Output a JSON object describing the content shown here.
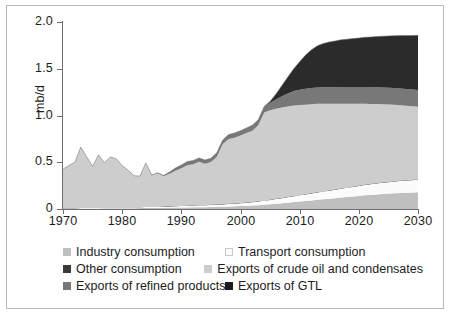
{
  "chart_data": {
    "type": "area",
    "stacked": true,
    "title": "",
    "subtitle": "",
    "xlabel": "",
    "ylabel": "mb/d",
    "xlim": [
      1970,
      2030
    ],
    "ylim": [
      0,
      2.0
    ],
    "grid": false,
    "legend_position": "bottom",
    "x_tick_labels": [
      "1970",
      "1980",
      "1990",
      "2000",
      "2010",
      "2020",
      "2030"
    ],
    "x_ticks": [
      1970,
      1980,
      1990,
      2000,
      2010,
      2020,
      2030
    ],
    "y_tick_labels": [
      "0",
      "0.5",
      "1.0",
      "1.5",
      "2.0"
    ],
    "y_ticks": [
      0,
      0.5,
      1.0,
      1.5,
      2.0
    ],
    "x": [
      1970,
      1971,
      1972,
      1973,
      1974,
      1975,
      1976,
      1977,
      1978,
      1979,
      1980,
      1981,
      1982,
      1983,
      1984,
      1985,
      1986,
      1987,
      1988,
      1989,
      1990,
      1991,
      1992,
      1993,
      1994,
      1995,
      1996,
      1997,
      1998,
      1999,
      2000,
      2001,
      2002,
      2003,
      2004,
      2005,
      2006,
      2007,
      2008,
      2009,
      2010,
      2011,
      2012,
      2013,
      2014,
      2015,
      2016,
      2017,
      2018,
      2019,
      2020,
      2021,
      2022,
      2023,
      2024,
      2025,
      2026,
      2027,
      2028,
      2029,
      2030
    ],
    "series": [
      {
        "name": "Industry consumption",
        "color": "#bfbfbf",
        "values": [
          0.005,
          0.005,
          0.005,
          0.005,
          0.006,
          0.006,
          0.006,
          0.007,
          0.007,
          0.008,
          0.008,
          0.009,
          0.009,
          0.01,
          0.011,
          0.012,
          0.012,
          0.013,
          0.014,
          0.015,
          0.016,
          0.017,
          0.018,
          0.019,
          0.02,
          0.021,
          0.023,
          0.025,
          0.027,
          0.029,
          0.031,
          0.034,
          0.037,
          0.041,
          0.045,
          0.05,
          0.056,
          0.062,
          0.068,
          0.074,
          0.08,
          0.086,
          0.092,
          0.098,
          0.104,
          0.11,
          0.116,
          0.122,
          0.128,
          0.134,
          0.14,
          0.146,
          0.151,
          0.156,
          0.161,
          0.165,
          0.169,
          0.172,
          0.175,
          0.177,
          0.18
        ]
      },
      {
        "name": "Transport consumption",
        "color": "#fbfbfb",
        "values": [
          0.004,
          0.004,
          0.004,
          0.005,
          0.005,
          0.005,
          0.006,
          0.006,
          0.007,
          0.007,
          0.008,
          0.008,
          0.009,
          0.009,
          0.01,
          0.011,
          0.011,
          0.012,
          0.013,
          0.014,
          0.015,
          0.016,
          0.017,
          0.018,
          0.019,
          0.021,
          0.022,
          0.024,
          0.026,
          0.028,
          0.03,
          0.033,
          0.036,
          0.039,
          0.042,
          0.046,
          0.05,
          0.054,
          0.058,
          0.062,
          0.066,
          0.07,
          0.074,
          0.078,
          0.082,
          0.086,
          0.09,
          0.094,
          0.098,
          0.102,
          0.106,
          0.11,
          0.113,
          0.116,
          0.119,
          0.122,
          0.125,
          0.127,
          0.129,
          0.131,
          0.133
        ]
      },
      {
        "name": "Other consumption",
        "color": "#3a3a3a",
        "values": [
          0.002,
          0.002,
          0.002,
          0.002,
          0.002,
          0.002,
          0.002,
          0.002,
          0.003,
          0.003,
          0.003,
          0.003,
          0.003,
          0.003,
          0.003,
          0.003,
          0.004,
          0.004,
          0.004,
          0.004,
          0.004,
          0.004,
          0.004,
          0.004,
          0.005,
          0.005,
          0.005,
          0.005,
          0.005,
          0.005,
          0.005,
          0.005,
          0.005,
          0.005,
          0.005,
          0.005,
          0.005,
          0.005,
          0.005,
          0.005,
          0.005,
          0.005,
          0.005,
          0.005,
          0.005,
          0.005,
          0.005,
          0.005,
          0.005,
          0.005,
          0.005,
          0.005,
          0.005,
          0.005,
          0.005,
          0.005,
          0.005,
          0.005,
          0.005,
          0.005,
          0.005
        ]
      },
      {
        "name": "Exports of crude oil and condensates",
        "color": "#cdcdcd",
        "values": [
          0.415,
          0.455,
          0.49,
          0.65,
          0.545,
          0.445,
          0.565,
          0.48,
          0.54,
          0.52,
          0.445,
          0.395,
          0.335,
          0.33,
          0.47,
          0.335,
          0.355,
          0.32,
          0.345,
          0.375,
          0.4,
          0.43,
          0.44,
          0.465,
          0.44,
          0.455,
          0.51,
          0.64,
          0.69,
          0.7,
          0.72,
          0.74,
          0.76,
          0.81,
          0.94,
          0.955,
          0.96,
          0.965,
          0.965,
          0.965,
          0.96,
          0.955,
          0.95,
          0.945,
          0.935,
          0.925,
          0.915,
          0.905,
          0.895,
          0.885,
          0.875,
          0.865,
          0.855,
          0.845,
          0.835,
          0.825,
          0.815,
          0.805,
          0.795,
          0.785,
          0.775
        ]
      },
      {
        "name": "Exports of refined products",
        "color": "#787878",
        "values": [
          0.0,
          0.0,
          0.0,
          0.0,
          0.0,
          0.0,
          0.0,
          0.0,
          0.0,
          0.0,
          0.0,
          0.0,
          0.0,
          0.0,
          0.0,
          0.003,
          0.006,
          0.01,
          0.02,
          0.03,
          0.035,
          0.04,
          0.04,
          0.04,
          0.04,
          0.04,
          0.042,
          0.045,
          0.048,
          0.05,
          0.052,
          0.055,
          0.058,
          0.06,
          0.065,
          0.08,
          0.1,
          0.12,
          0.14,
          0.155,
          0.165,
          0.17,
          0.172,
          0.174,
          0.175,
          0.176,
          0.177,
          0.178,
          0.178,
          0.179,
          0.179,
          0.18,
          0.18,
          0.18,
          0.18,
          0.18,
          0.18,
          0.18,
          0.18,
          0.18,
          0.18
        ]
      },
      {
        "name": "Exports of GTL",
        "color": "#2b2b2b",
        "values": [
          0.0,
          0.0,
          0.0,
          0.0,
          0.0,
          0.0,
          0.0,
          0.0,
          0.0,
          0.0,
          0.0,
          0.0,
          0.0,
          0.0,
          0.0,
          0.0,
          0.0,
          0.0,
          0.0,
          0.0,
          0.0,
          0.0,
          0.0,
          0.0,
          0.0,
          0.0,
          0.0,
          0.0,
          0.0,
          0.0,
          0.0,
          0.0,
          0.0,
          0.0,
          0.0,
          0.015,
          0.06,
          0.115,
          0.175,
          0.24,
          0.3,
          0.36,
          0.41,
          0.445,
          0.47,
          0.485,
          0.495,
          0.505,
          0.512,
          0.518,
          0.524,
          0.53,
          0.536,
          0.542,
          0.548,
          0.554,
          0.56,
          0.566,
          0.572,
          0.578,
          0.584
        ]
      }
    ]
  },
  "axes": {
    "ylabel": "mb/d",
    "y_tick_labels": [
      "2.0",
      "1.5",
      "1.0",
      "0.5",
      "0"
    ],
    "x_tick_labels": [
      "1970",
      "1980",
      "1990",
      "2000",
      "2010",
      "2020",
      "2030"
    ]
  },
  "legend": {
    "rows": [
      {
        "left": {
          "label": "Industry consumption",
          "color": "#bfbfbf",
          "outlined": false
        },
        "right": {
          "label": "Transport consumption",
          "color": "#fbfbfb",
          "outlined": true
        }
      },
      {
        "left": {
          "label": "Other consumption",
          "color": "#3a3a3a",
          "outlined": false
        },
        "right": {
          "label": "Exports of crude oil and condensates",
          "color": "#cdcdcd",
          "outlined": false
        }
      },
      {
        "left": {
          "label": "Exports of refined products",
          "color": "#787878",
          "outlined": false
        },
        "right": {
          "label": "Exports of GTL",
          "color": "#1b1b1b",
          "outlined": false
        }
      }
    ]
  },
  "colors": {
    "frame": "#b9b9b9",
    "axis": "#6e6e6e",
    "text": "#1c1c1c",
    "background": "#ffffff"
  }
}
